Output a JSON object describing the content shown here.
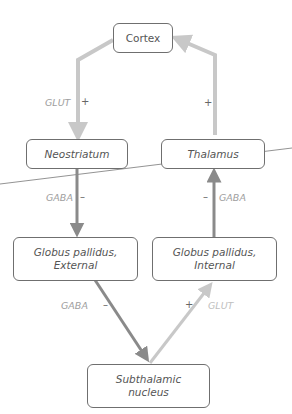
{
  "nodes": {
    "cortex": "Cortex",
    "neostriatum": "Neostriatum",
    "thalamus": "Thalamus",
    "gpe_line1": "Globus pallidus,",
    "gpe_line2": "External",
    "gpi_line1": "Globus pallidus,",
    "gpi_line2": "Internal",
    "stn_line1": "Subthalamic",
    "stn_line2": "nucleus"
  },
  "edges": [
    {
      "from": "Cortex",
      "to": "Neostriatum",
      "transmitter": "GLUT",
      "sign": "+",
      "color": "#c8c8c8"
    },
    {
      "from": "Thalamus",
      "to": "Cortex",
      "transmitter": "",
      "sign": "+",
      "color": "#c8c8c8"
    },
    {
      "from": "Neostriatum",
      "to": "Globus pallidus, External",
      "transmitter": "GABA",
      "sign": "–",
      "color": "#8a8a8a"
    },
    {
      "from": "Globus pallidus, Internal",
      "to": "Thalamus",
      "transmitter": "GABA",
      "sign": "–",
      "color": "#8a8a8a"
    },
    {
      "from": "Globus pallidus, External",
      "to": "Subthalamic nucleus",
      "transmitter": "GABA",
      "sign": "–",
      "color": "#8a8a8a"
    },
    {
      "from": "Subthalamic nucleus",
      "to": "Globus pallidus, Internal",
      "transmitter": "GLUT",
      "sign": "+",
      "color": "#c8c8c8"
    }
  ],
  "labels": {
    "glut_left": "GLUT",
    "plus_left": "+",
    "plus_right": "+",
    "gaba_left": "GABA",
    "minus_left": "–",
    "minus_right": "–",
    "gaba_right": "GABA",
    "gaba_bottom": "GABA",
    "minus_bottom": "–",
    "plus_bottom": "+",
    "glut_bottom": "GLUT"
  },
  "colors": {
    "excitatory": "#c8c8c8",
    "inhibitory": "#8a8a8a",
    "box_border": "#6f6f6f"
  }
}
